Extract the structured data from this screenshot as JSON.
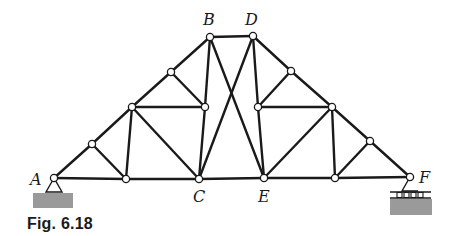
{
  "figure": {
    "caption": "Fig. 6.18",
    "type": "truss",
    "colors": {
      "line": "#1a1a1a",
      "ground_hatch": "#9a9a9a",
      "background": "#ffffff"
    }
  },
  "labels": {
    "A": "A",
    "B": "B",
    "C": "C",
    "D": "D",
    "E": "E",
    "F": "F"
  },
  "nodes": {
    "A": [
      54,
      178
    ],
    "L1": [
      126,
      179
    ],
    "C": [
      199,
      179
    ],
    "E": [
      264,
      178
    ],
    "R1": [
      335,
      178
    ],
    "F": [
      410,
      177
    ],
    "T1": [
      92,
      144
    ],
    "T2": [
      132,
      107
    ],
    "T3": [
      171,
      72
    ],
    "B": [
      210,
      37
    ],
    "D": [
      253,
      36
    ],
    "T4": [
      291,
      71
    ],
    "T5": [
      332,
      107
    ],
    "T6": [
      370,
      141
    ],
    "IL": [
      205,
      107
    ],
    "IR": [
      258,
      107
    ]
  },
  "members": [
    [
      "A",
      "L1"
    ],
    [
      "L1",
      "C"
    ],
    [
      "C",
      "E"
    ],
    [
      "E",
      "R1"
    ],
    [
      "R1",
      "F"
    ],
    [
      "A",
      "T1"
    ],
    [
      "T1",
      "T2"
    ],
    [
      "T2",
      "T3"
    ],
    [
      "T3",
      "B"
    ],
    [
      "B",
      "D"
    ],
    [
      "D",
      "T4"
    ],
    [
      "T4",
      "T5"
    ],
    [
      "T5",
      "T6"
    ],
    [
      "T6",
      "F"
    ],
    [
      "T1",
      "L1"
    ],
    [
      "T2",
      "L1"
    ],
    [
      "T2",
      "C"
    ],
    [
      "T2",
      "IL"
    ],
    [
      "T3",
      "IL"
    ],
    [
      "B",
      "IL"
    ],
    [
      "IL",
      "C"
    ],
    [
      "B",
      "E"
    ],
    [
      "D",
      "C"
    ],
    [
      "D",
      "IR"
    ],
    [
      "IR",
      "E"
    ],
    [
      "T4",
      "IR"
    ],
    [
      "IR",
      "T5"
    ],
    [
      "T5",
      "E"
    ],
    [
      "T5",
      "R1"
    ],
    [
      "T6",
      "R1"
    ]
  ],
  "supports": {
    "A": {
      "type": "pin"
    },
    "F": {
      "type": "roller"
    }
  }
}
